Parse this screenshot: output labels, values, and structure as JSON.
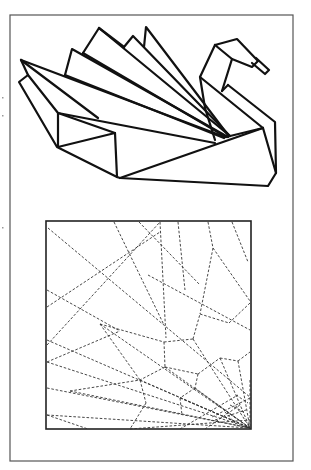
{
  "figure": {
    "title": "",
    "colors": {
      "ink": "#111111",
      "frame": "#555555",
      "crease": "#333333",
      "background": "#ffffff"
    },
    "outer_frame": {
      "x": 10,
      "y": 15,
      "w": 283,
      "h": 446
    },
    "folded_model": {
      "label": "",
      "description": "line drawing of folded origami swan with fanned tail feathers"
    },
    "crease_pattern": {
      "label": "",
      "square": {
        "x": 46,
        "y": 221,
        "w": 205,
        "h": 208
      },
      "line_style": "dashed"
    }
  }
}
